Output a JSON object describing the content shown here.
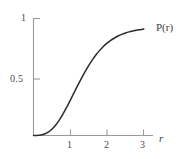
{
  "figure": {
    "kind": "line-plot",
    "background_color": "#ffffff",
    "axis_color": "#9a9a9a",
    "curve_color": "#2b2b2b",
    "text_color": "#4a4a4a"
  },
  "labels": {
    "curve_label": "P(r)",
    "curve_label_symbol": "P",
    "curve_label_arg": "(r)",
    "x_axis_name": "r",
    "y_tick_1": "1",
    "y_tick_05": "0.5",
    "x_tick_1": "1",
    "x_tick_2": "2",
    "x_tick_3": "3"
  },
  "chart_data": {
    "type": "line",
    "title": "",
    "subtitle": "",
    "xlabel": "r",
    "ylabel": "",
    "series": [
      {
        "name": "P(r)",
        "x": [
          0.0,
          0.1,
          0.2,
          0.3,
          0.4,
          0.5,
          0.6,
          0.7,
          0.8,
          0.9,
          1.0,
          1.1,
          1.2,
          1.3,
          1.4,
          1.5,
          1.6,
          1.7,
          1.8,
          1.9,
          2.0,
          2.1,
          2.2,
          2.3,
          2.4,
          2.5,
          2.6,
          2.7,
          2.8,
          2.9,
          3.0
        ],
        "y": [
          0.0,
          0.001,
          0.004,
          0.013,
          0.03,
          0.056,
          0.092,
          0.138,
          0.192,
          0.252,
          0.316,
          0.382,
          0.448,
          0.511,
          0.571,
          0.627,
          0.678,
          0.724,
          0.764,
          0.799,
          0.829,
          0.854,
          0.875,
          0.893,
          0.908,
          0.92,
          0.93,
          0.938,
          0.945,
          0.95,
          0.955
        ]
      }
    ],
    "xlim": [
      0,
      3.25
    ],
    "ylim": [
      0,
      1.05
    ],
    "xticks": [
      1,
      2,
      3
    ],
    "xtick_labels": [
      "1",
      "2",
      "3"
    ],
    "yticks": [
      0.5,
      1
    ],
    "ytick_labels": [
      "0.5",
      "1"
    ],
    "grid": false,
    "legend": false,
    "annotations": [
      {
        "text": "P(r)",
        "x": 3.15,
        "y": 0.9,
        "note": "curve label at right end of curve"
      }
    ]
  }
}
